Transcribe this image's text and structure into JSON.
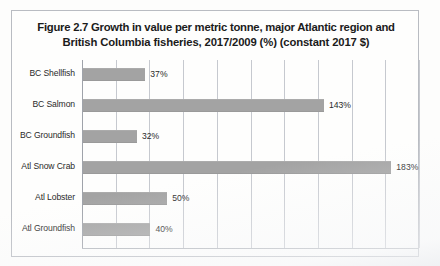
{
  "figure": {
    "title_line1": "Figure 2.7 Growth in value per metric tonne, major Atlantic region and",
    "title_line2": "British Columbia fisheries, 2017/2009 (%) (constant 2017 $)"
  },
  "colors": {
    "bar_fill": "#a3a3a3",
    "gridline": "#c6c9cf",
    "border": "#b9bcc2",
    "text": "#2a2a2a",
    "background": "#fefefd"
  },
  "chart_data": {
    "type": "bar",
    "orientation": "horizontal",
    "title": "Figure 2.7 Growth in value per metric tonne, major Atlantic region and British Columbia fisheries, 2017/2009 (%) (constant 2017 $)",
    "xlabel": "",
    "ylabel": "",
    "xlim": [
      0,
      200
    ],
    "grid": true,
    "gridline_values": [
      0,
      20,
      40,
      60,
      80,
      100,
      120,
      140,
      160,
      180,
      200
    ],
    "legend": null,
    "categories": [
      "BC Shellfish",
      "BC Salmon",
      "BC Groundfish",
      "Atl Snow Crab",
      "Atl Lobster",
      "Atl Groundfish"
    ],
    "values": [
      37,
      143,
      32,
      183,
      50,
      40
    ],
    "data_labels": [
      "37%",
      "143%",
      "32%",
      "183%",
      "50%",
      "40%"
    ]
  },
  "rows": [
    {
      "label": "BC Shellfish",
      "value": 37,
      "label_text": "37%"
    },
    {
      "label": "BC Salmon",
      "value": 143,
      "label_text": "143%"
    },
    {
      "label": "BC Groundfish",
      "value": 32,
      "label_text": "32%"
    },
    {
      "label": "Atl Snow Crab",
      "value": 183,
      "label_text": "183%"
    },
    {
      "label": "Atl Lobster",
      "value": 50,
      "label_text": "50%"
    },
    {
      "label": "Atl Groundfish",
      "value": 40,
      "label_text": "40%"
    }
  ]
}
